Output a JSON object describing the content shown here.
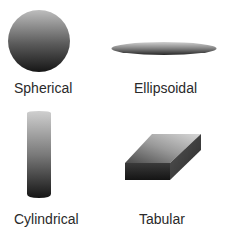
{
  "shapes": [
    {
      "id": "spherical",
      "label": "Spherical"
    },
    {
      "id": "ellipsoidal",
      "label": "Ellipsoidal"
    },
    {
      "id": "cylindrical",
      "label": "Cylindrical"
    },
    {
      "id": "tabular",
      "label": "Tabular"
    }
  ],
  "colors": {
    "shade_light": "#c8c8c8",
    "shade_dark": "#1c1c1c",
    "label_text": "#2a2a2a"
  }
}
